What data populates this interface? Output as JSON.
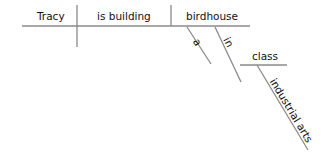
{
  "diagram": {
    "type": "sentence-diagram",
    "subject": "Tracy",
    "verb": "is building",
    "object": "birdhouse",
    "modifiers": {
      "article": "a",
      "preposition": "in",
      "prep_object": "class",
      "prep_object_modifier": "industrial arts"
    },
    "line_color": "#8a8a8a",
    "text_color": "#111111"
  }
}
